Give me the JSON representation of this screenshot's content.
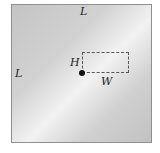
{
  "diagram": {
    "labels": {
      "top_side": "L",
      "left_side": "L",
      "height": "H",
      "width": "W"
    },
    "shape": "square plate with dashed rectangle anchored at a point",
    "colors": {
      "plate_border": "#8f8f8f",
      "dash": "#555555",
      "point": "#111111"
    }
  }
}
